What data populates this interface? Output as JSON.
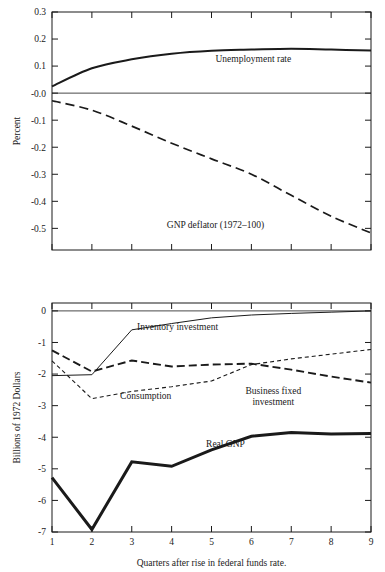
{
  "figure": {
    "background": "#ffffff",
    "ink": "#1a1a1a"
  },
  "chart_data": [
    {
      "id": "top-panel",
      "type": "line",
      "title": "",
      "xlabel": "",
      "ylabel": "Percent",
      "xlim": [
        1,
        9
      ],
      "ylim": [
        -0.58,
        0.3
      ],
      "grid": false,
      "legend_position": "inline-annotations",
      "x": [
        1,
        2,
        3,
        4,
        5,
        6,
        7,
        8,
        9
      ],
      "yticks": [
        0.3,
        0.2,
        0.1,
        -0.0,
        -0.1,
        -0.2,
        -0.3,
        -0.4,
        -0.5
      ],
      "yticklabels": [
        "0.3",
        "0.2",
        "0.1",
        "-0.0",
        "-0.1",
        "-0.2",
        "-0.3",
        "-0.4",
        "-0.5"
      ],
      "xticks": [
        1,
        2,
        3,
        4,
        5,
        6,
        7,
        8,
        9
      ],
      "xticklabels": [
        "",
        "",
        "",
        "",
        "",
        "",
        "",
        "",
        ""
      ],
      "series": [
        {
          "name": "Unemployment rate",
          "style": "solid-thick",
          "stroke_width": 2.0,
          "dash": "none",
          "values": [
            0.025,
            0.092,
            0.125,
            0.146,
            0.157,
            0.161,
            0.164,
            0.161,
            0.158
          ],
          "label": "Unemployment rate",
          "label_x": 6.05,
          "label_y": 0.115
        },
        {
          "name": "GNP deflator (1972-100)",
          "style": "dashed-long",
          "stroke_width": 1.7,
          "dash": "9,5",
          "values": [
            -0.028,
            -0.063,
            -0.122,
            -0.185,
            -0.243,
            -0.3,
            -0.378,
            -0.455,
            -0.517
          ],
          "label": "GNP deflator (1972–100)",
          "label_x": 5.1,
          "label_y": -0.5
        }
      ]
    },
    {
      "id": "bottom-panel",
      "type": "line",
      "title": "",
      "xlabel": "Quarters after rise in federal funds rate.",
      "ylabel": "Billions of 1972 Dollars",
      "xlim": [
        1,
        9
      ],
      "ylim": [
        -7,
        0.25
      ],
      "grid": false,
      "legend_position": "inline-annotations",
      "x": [
        1,
        2,
        3,
        4,
        5,
        6,
        7,
        8,
        9
      ],
      "yticks": [
        0,
        -1,
        -2,
        -3,
        -4,
        -5,
        -6,
        -7
      ],
      "yticklabels": [
        "0",
        "-1",
        "-2",
        "-3",
        "-4",
        "-5",
        "-6",
        "-7"
      ],
      "xticks": [
        1,
        2,
        3,
        4,
        5,
        6,
        7,
        8,
        9
      ],
      "xticklabels": [
        "1",
        "2",
        "3",
        "4",
        "5",
        "6",
        "7",
        "8",
        "9"
      ],
      "series": [
        {
          "name": "Inventory investment",
          "style": "solid-thin",
          "stroke_width": 1.0,
          "dash": "none",
          "values": [
            -2.05,
            -2.02,
            -0.6,
            -0.4,
            -0.22,
            -0.13,
            -0.08,
            -0.04,
            0.0
          ],
          "label": "Inventory investment",
          "label_x": 4.15,
          "label_y": -0.62
        },
        {
          "name": "Business fixed investment",
          "style": "dashed-long",
          "stroke_width": 1.9,
          "dash": "8,4",
          "values": [
            -1.25,
            -1.92,
            -1.57,
            -1.76,
            -1.7,
            -1.67,
            -1.86,
            -2.08,
            -2.27
          ],
          "label": "Business fixed investment",
          "label_lines": [
            "Business fixed",
            "investment"
          ],
          "label_x": 6.55,
          "label_y": -2.62
        },
        {
          "name": "Consumption",
          "style": "dashed-short",
          "stroke_width": 1.1,
          "dash": "4,3",
          "values": [
            -1.58,
            -2.78,
            -2.55,
            -2.4,
            -2.22,
            -1.7,
            -1.52,
            -1.37,
            -1.22
          ],
          "label": "Consumption",
          "label_x": 3.35,
          "label_y": -2.78
        },
        {
          "name": "Real GNP",
          "style": "solid-heavy",
          "stroke_width": 3.0,
          "dash": "none",
          "values": [
            -5.28,
            -6.92,
            -4.78,
            -4.92,
            -4.4,
            -3.97,
            -3.85,
            -3.9,
            -3.88
          ],
          "label": "Real GNP",
          "label_x": 5.35,
          "label_y": -4.3
        }
      ]
    }
  ]
}
